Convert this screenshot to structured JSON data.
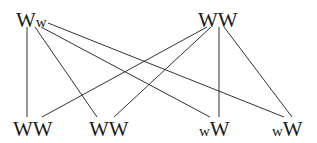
{
  "diagram": {
    "type": "bipartite-graph",
    "line_color": "#333333",
    "top_nodes": [
      {
        "id": "t1",
        "parts": [
          {
            "text": "W",
            "size": "big"
          },
          {
            "text": "w",
            "size": "small"
          }
        ],
        "label": "Ww"
      },
      {
        "id": "t2",
        "parts": [
          {
            "text": "W",
            "size": "big"
          },
          {
            "text": "W",
            "size": "big"
          }
        ],
        "label": "WW"
      }
    ],
    "bottom_nodes": [
      {
        "id": "b1",
        "parts": [
          {
            "text": "W",
            "size": "big"
          },
          {
            "text": "W",
            "size": "big"
          }
        ],
        "label": "WW"
      },
      {
        "id": "b2",
        "parts": [
          {
            "text": "W",
            "size": "big"
          },
          {
            "text": "W",
            "size": "big"
          }
        ],
        "label": "WW"
      },
      {
        "id": "b3",
        "parts": [
          {
            "text": "w",
            "size": "small"
          },
          {
            "text": "W",
            "size": "big"
          }
        ],
        "label": "wW"
      },
      {
        "id": "b4",
        "parts": [
          {
            "text": "w",
            "size": "small"
          },
          {
            "text": "W",
            "size": "big"
          }
        ],
        "label": "wW"
      }
    ],
    "edges": [
      [
        "t1",
        "b1"
      ],
      [
        "t1",
        "b2"
      ],
      [
        "t1",
        "b3"
      ],
      [
        "t1",
        "b4"
      ],
      [
        "t2",
        "b1"
      ],
      [
        "t2",
        "b2"
      ],
      [
        "t2",
        "b3"
      ],
      [
        "t2",
        "b4"
      ]
    ]
  }
}
